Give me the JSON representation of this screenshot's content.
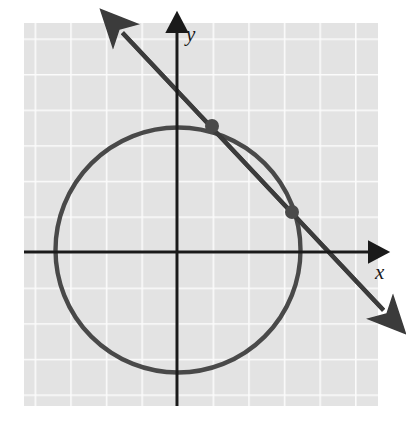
{
  "figure": {
    "axis_labels": {
      "x": "x",
      "y": "y"
    },
    "colors": {
      "plot_background": "#e3e3e3",
      "gridline": "#fbfbfb",
      "axis": "#1a1a1a",
      "curve": "#4a4a4a",
      "line": "#3a3a3a",
      "point": "#4a4a4a",
      "page_background": "#ffffff"
    }
  },
  "chart_data": {
    "type": "scatter",
    "xlabel": "x",
    "ylabel": "y",
    "grid": true,
    "legend": null,
    "axis_arrows": [
      "x-positive",
      "y-positive"
    ],
    "plot_area_px": {
      "left": 24,
      "top": 23,
      "right": 378,
      "bottom": 406
    },
    "origin_px": {
      "x": 177,
      "y": 252
    },
    "grid_spacing_px": {
      "x": 35.6,
      "y": 35.6
    },
    "xlim": [
      -4.3,
      5.65
    ],
    "ylim": [
      -4.33,
      6.44
    ],
    "series": [
      {
        "name": "circle",
        "type": "circle",
        "center": [
          0.03,
          -0.06
        ],
        "radius": 3.6,
        "center_px": [
          178,
          250
        ],
        "radius_px": 128
      },
      {
        "name": "secant-line",
        "type": "line",
        "slope": -0.725,
        "intercept": 2.68,
        "endpoints_px": [
          [
            118,
            28
          ],
          [
            388,
            315
          ]
        ],
        "arrowheads": [
          "start",
          "end"
        ]
      }
    ],
    "points": [
      {
        "label": "intersection-1",
        "xy": [
          0.98,
          3.54
        ],
        "xy_px": [
          212,
          126
        ]
      },
      {
        "label": "intersection-2",
        "xy": [
          3.23,
          1.12
        ],
        "xy_px": [
          292,
          212
        ]
      }
    ],
    "annotations": []
  }
}
